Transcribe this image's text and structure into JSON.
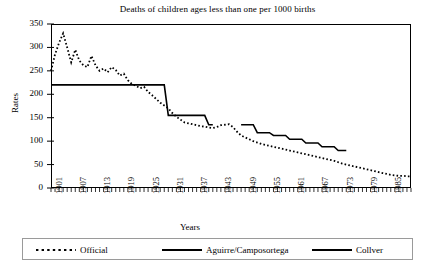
{
  "chart_data": {
    "type": "line",
    "title": "Deaths of children ages less than one per 1000 births",
    "xlabel": "Years",
    "ylabel": "Rates",
    "xlim": [
      1901,
      1990
    ],
    "ylim": [
      0,
      350
    ],
    "ytick_values": [
      0,
      50,
      100,
      150,
      200,
      250,
      300,
      350
    ],
    "ytick_labels": [
      "0",
      "50",
      "100",
      "150",
      "200",
      "250",
      "300",
      "350"
    ],
    "xtick_labels": [
      "1901",
      "1907",
      "1913",
      "1919",
      "1925",
      "1931",
      "1937",
      "1943",
      "1949",
      "1955",
      "1961",
      "1967",
      "1973",
      "1979",
      "1985"
    ],
    "xtick_values": [
      1901,
      1907,
      1913,
      1919,
      1925,
      1931,
      1937,
      1943,
      1949,
      1955,
      1961,
      1967,
      1973,
      1979,
      1985
    ],
    "xtick_step_minor": 1,
    "grid": false,
    "legend_position": "bottom",
    "series": [
      {
        "name": "Official",
        "style": "dashed",
        "color": "#000000",
        "x": [
          1901,
          1902,
          1903,
          1904,
          1905,
          1906,
          1907,
          1908,
          1909,
          1910,
          1911,
          1912,
          1913,
          1914,
          1915,
          1916,
          1917,
          1918,
          1919,
          1920,
          1921,
          1922,
          1923,
          1924,
          1925,
          1926,
          1927,
          1928,
          1929,
          1930,
          1931,
          1932,
          1933,
          1934,
          1935,
          1936,
          1937,
          1938,
          1939,
          1940,
          1941,
          1942,
          1943,
          1944,
          1945,
          1946,
          1947,
          1948,
          1949,
          1950,
          1951,
          1952,
          1953,
          1954,
          1955,
          1956,
          1957,
          1958,
          1959,
          1960,
          1961,
          1962,
          1963,
          1964,
          1965,
          1966,
          1967,
          1968,
          1969,
          1970,
          1971,
          1972,
          1973,
          1974,
          1975,
          1976,
          1977,
          1978,
          1979,
          1980,
          1981,
          1982,
          1983,
          1984,
          1985,
          1986,
          1987,
          1988,
          1989,
          1990
        ],
        "y": [
          250,
          285,
          310,
          330,
          300,
          268,
          295,
          272,
          262,
          258,
          282,
          262,
          250,
          255,
          247,
          258,
          252,
          240,
          244,
          230,
          222,
          218,
          213,
          216,
          205,
          198,
          190,
          182,
          176,
          170,
          160,
          152,
          146,
          140,
          138,
          136,
          134,
          132,
          131,
          129,
          128,
          130,
          134,
          135,
          136,
          130,
          120,
          112,
          108,
          104,
          100,
          97,
          94,
          92,
          90,
          88,
          86,
          84,
          82,
          80,
          78,
          76,
          74,
          72,
          70,
          68,
          66,
          64,
          62,
          60,
          58,
          55,
          52,
          50,
          48,
          46,
          44,
          42,
          40,
          38,
          36,
          34,
          32,
          30,
          28,
          27,
          26,
          26,
          25,
          25
        ]
      },
      {
        "name": "Aguirre/Camposortega",
        "style": "solid",
        "color": "#000000",
        "x": [
          1948,
          1949,
          1950,
          1951,
          1952,
          1953,
          1954,
          1955,
          1956,
          1957,
          1958,
          1959,
          1960,
          1961,
          1962,
          1963,
          1964,
          1965,
          1966,
          1967,
          1968,
          1969,
          1970,
          1971,
          1972,
          1973,
          1974
        ],
        "y": [
          135,
          135,
          135,
          135,
          118,
          118,
          118,
          118,
          112,
          112,
          112,
          112,
          104,
          104,
          104,
          104,
          96,
          96,
          96,
          96,
          88,
          88,
          88,
          88,
          80,
          80,
          80
        ]
      },
      {
        "name": "Collver",
        "style": "solid",
        "color": "#000000",
        "x": [
          1901,
          1902,
          1903,
          1904,
          1905,
          1906,
          1907,
          1908,
          1909,
          1910,
          1911,
          1912,
          1913,
          1914,
          1915,
          1916,
          1917,
          1918,
          1919,
          1920,
          1921,
          1922,
          1923,
          1924,
          1925,
          1926,
          1927,
          1928,
          1929,
          1930,
          1931,
          1932,
          1933,
          1934,
          1935,
          1936,
          1937,
          1938,
          1939,
          1940,
          1941
        ],
        "y": [
          220,
          220,
          220,
          220,
          220,
          220,
          220,
          220,
          220,
          220,
          220,
          220,
          220,
          220,
          220,
          220,
          220,
          220,
          220,
          220,
          220,
          220,
          220,
          220,
          220,
          220,
          220,
          220,
          220,
          155,
          155,
          155,
          155,
          155,
          155,
          155,
          155,
          155,
          155,
          135,
          135
        ]
      }
    ]
  },
  "legend": {
    "items": [
      {
        "label": "Official",
        "style": "dashed"
      },
      {
        "label": "Aguirre/Camposortega",
        "style": "solid"
      },
      {
        "label": "Collver",
        "style": "solid"
      }
    ]
  }
}
